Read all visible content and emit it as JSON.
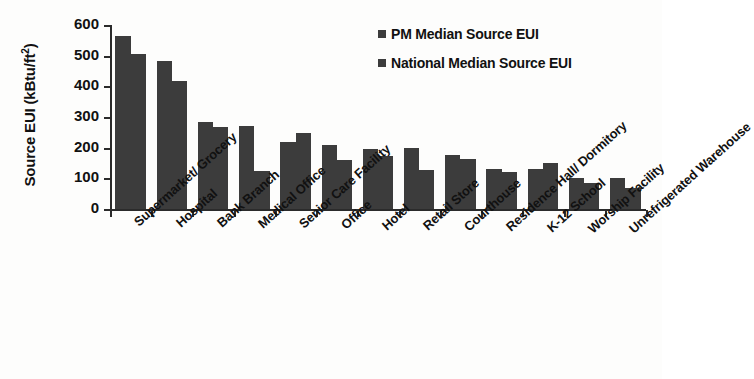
{
  "chart_data": {
    "type": "bar",
    "title": "",
    "xlabel": "",
    "ylabel": "Source EUI (kBtu/ft2)",
    "ylabel_base": "Source EUI (kBtu/ft",
    "ylabel_sup": "2",
    "ylabel_tail": ")",
    "ylim": [
      0,
      600
    ],
    "ytick_step": 100,
    "yticks": [
      600,
      500,
      400,
      300,
      200,
      100,
      0
    ],
    "grid": false,
    "legend_position": "top-right",
    "categories": [
      "Supermarket/ Grocery",
      "Hospital",
      "Bank Branch",
      "Medical Office",
      "Senior Care Facility",
      "Office",
      "Hotel",
      "Retail Store",
      "Courthouse",
      "Residence Hall/ Dormitory",
      "K-12 School",
      "Worship Facility",
      "Unrefrigerated Warehouse"
    ],
    "series": [
      {
        "name": "PM Median Source EUI",
        "color": "#3c3c3c",
        "values": [
          563,
          482,
          283,
          270,
          220,
          209,
          196,
          199,
          176,
          130,
          130,
          101,
          101
        ]
      },
      {
        "name": "National Median Source EUI",
        "color": "#3c3c3c",
        "values": [
          505,
          417,
          267,
          124,
          248,
          160,
          173,
          127,
          163,
          121,
          150,
          85,
          68
        ]
      }
    ]
  },
  "legend": {
    "items": [
      {
        "label": "PM Median Source EUI"
      },
      {
        "label": "National Median Source EUI"
      }
    ]
  },
  "colors": {
    "bar": "#3c3c3c",
    "axis": "#2b2b2b",
    "background": "#fdfdfc"
  }
}
